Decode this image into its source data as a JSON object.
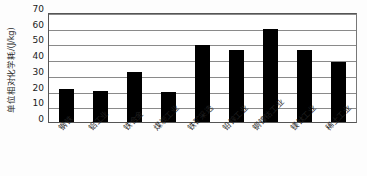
{
  "chart_data": {
    "type": "bar",
    "title": "",
    "subtitle": "",
    "xlabel": "",
    "ylabel": "单位相对化学耗/(J/kg)",
    "ylim": [
      0,
      70
    ],
    "ytick_interval": 10,
    "yticks": [
      70,
      60,
      50,
      40,
      30,
      20,
      10,
      0
    ],
    "grid": true,
    "legend": false,
    "legend_position": "none",
    "bar_color": "#000000",
    "categories": [
      "钢铁",
      "铝工业",
      "铁合金",
      "煤炭工业",
      "铁矿采选",
      "铅锌工业",
      "铜镍钴工业",
      "镁钛工业",
      "稀土工业"
    ],
    "values": [
      21,
      20,
      32,
      19,
      49,
      46,
      59,
      46,
      38
    ]
  }
}
